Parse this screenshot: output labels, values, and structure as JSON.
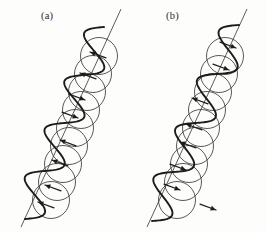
{
  "figure": {
    "background_color": "#fdfdfc",
    "ink_color": "#1c1c1c",
    "circle_color": "#3a3a3a",
    "axis_color": "#4a4a44",
    "width": 267,
    "height": 233
  },
  "panels": [
    {
      "id": "panel-a",
      "label": "(a)",
      "label_position": {
        "x": 41,
        "y": 10
      },
      "axis": {
        "x1": 121,
        "y1": 9,
        "x2": 21,
        "y2": 227
      },
      "circle_radius": 18.5,
      "circle_centers": [
        {
          "x": 99,
          "y": 56
        },
        {
          "x": 93,
          "y": 74
        },
        {
          "x": 87,
          "y": 92
        },
        {
          "x": 81,
          "y": 110
        },
        {
          "x": 75,
          "y": 128
        },
        {
          "x": 69,
          "y": 146
        },
        {
          "x": 63,
          "y": 164
        },
        {
          "x": 57,
          "y": 182
        },
        {
          "x": 51,
          "y": 200
        }
      ],
      "wave": {
        "amplitude": 16,
        "cycles": 4,
        "start": {
          "x": 104,
          "y": 27
        },
        "end": {
          "x": 25,
          "y": 219
        }
      },
      "arrows": [
        {
          "x": 90,
          "y": 52,
          "angle": 200
        },
        {
          "x": 80,
          "y": 73,
          "angle": 200
        },
        {
          "x": 85,
          "y": 100,
          "angle": 20
        },
        {
          "x": 78,
          "y": 118,
          "angle": 20
        },
        {
          "x": 60,
          "y": 140,
          "angle": 200
        },
        {
          "x": 52,
          "y": 160,
          "angle": 200
        },
        {
          "x": 45,
          "y": 185,
          "angle": 200
        },
        {
          "x": 38,
          "y": 202,
          "angle": 200
        }
      ],
      "arrow_direction": "up-left"
    },
    {
      "id": "panel-b",
      "label": "(b)",
      "label_position": {
        "x": 166,
        "y": 10
      },
      "axis": {
        "x1": 247,
        "y1": 9,
        "x2": 147,
        "y2": 227
      },
      "circle_radius": 18.5,
      "circle_centers": [
        {
          "x": 225,
          "y": 56
        },
        {
          "x": 219,
          "y": 74
        },
        {
          "x": 213,
          "y": 92
        },
        {
          "x": 207,
          "y": 110
        },
        {
          "x": 201,
          "y": 128
        },
        {
          "x": 195,
          "y": 146
        },
        {
          "x": 189,
          "y": 164
        },
        {
          "x": 183,
          "y": 182
        },
        {
          "x": 177,
          "y": 200
        }
      ],
      "wave": {
        "amplitude": 16,
        "cycles": 4,
        "start": {
          "x": 239,
          "y": 25
        },
        "end": {
          "x": 152,
          "y": 221
        }
      },
      "arrows": [
        {
          "x": 236,
          "y": 48,
          "angle": 20
        },
        {
          "x": 229,
          "y": 70,
          "angle": 20
        },
        {
          "x": 192,
          "y": 98,
          "angle": 200
        },
        {
          "x": 186,
          "y": 124,
          "angle": 200
        },
        {
          "x": 180,
          "y": 142,
          "angle": 200
        },
        {
          "x": 186,
          "y": 170,
          "angle": 20
        },
        {
          "x": 180,
          "y": 190,
          "angle": 20
        },
        {
          "x": 216,
          "y": 210,
          "angle": 20
        }
      ],
      "arrow_direction": "mixed"
    }
  ]
}
